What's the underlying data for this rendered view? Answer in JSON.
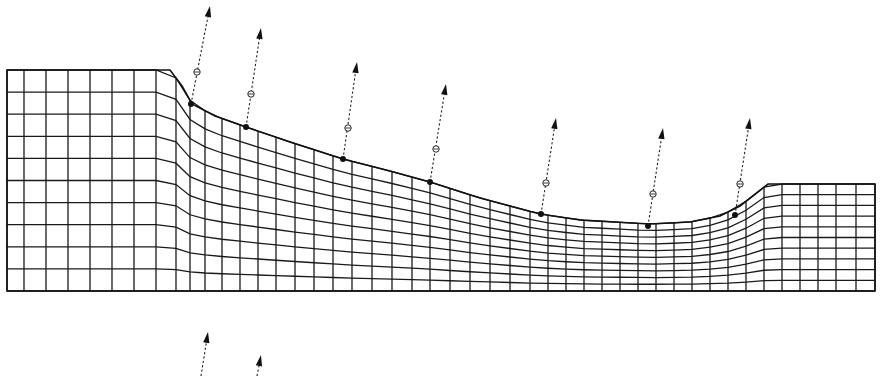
{
  "figure": {
    "width": 881,
    "height": 376,
    "colors": {
      "line": "#1a1a1a",
      "background": "#ffffff"
    }
  },
  "mesh": {
    "left_x": 7,
    "right_x": 875,
    "bottom_y": 291,
    "rows": 10,
    "surface_profile": [
      [
        7,
        70
      ],
      [
        170,
        70
      ],
      [
        182,
        86
      ],
      [
        192,
        104
      ],
      [
        215,
        116
      ],
      [
        246,
        127
      ],
      [
        290,
        142
      ],
      [
        343,
        159
      ],
      [
        390,
        171
      ],
      [
        430,
        182
      ],
      [
        480,
        198
      ],
      [
        540,
        214
      ],
      [
        580,
        220
      ],
      [
        615,
        222
      ],
      [
        650,
        224
      ],
      [
        690,
        222
      ],
      [
        720,
        216
      ],
      [
        740,
        206
      ],
      [
        768,
        184
      ],
      [
        875,
        184
      ]
    ],
    "columns_x": [
      7,
      24,
      46,
      68,
      90,
      112,
      134,
      156,
      176,
      190,
      205,
      222,
      240,
      258,
      276,
      295,
      314,
      333,
      352,
      372,
      392,
      412,
      430,
      450,
      470,
      490,
      510,
      530,
      548,
      566,
      584,
      602,
      620,
      638,
      656,
      674,
      692,
      710,
      728,
      746,
      764,
      782,
      800,
      818,
      836,
      856,
      875
    ]
  },
  "normal_vectors": [
    {
      "node": [
        191,
        104
      ],
      "mid": [
        197,
        72
      ],
      "tip": [
        210,
        6
      ]
    },
    {
      "node": [
        246,
        127
      ],
      "mid": [
        251,
        94
      ],
      "tip": [
        261,
        28
      ]
    },
    {
      "node": [
        343,
        159
      ],
      "mid": [
        348,
        128
      ],
      "tip": [
        357,
        62
      ]
    },
    {
      "node": [
        430,
        182
      ],
      "mid": [
        436,
        149
      ],
      "tip": [
        446,
        84
      ]
    },
    {
      "node": [
        541,
        214
      ],
      "mid": [
        546,
        183
      ],
      "tip": [
        556,
        118
      ]
    },
    {
      "node": [
        648,
        226
      ],
      "mid": [
        653,
        194
      ],
      "tip": [
        663,
        128
      ]
    },
    {
      "node": [
        735,
        215
      ],
      "mid": [
        740,
        184
      ],
      "tip": [
        750,
        118
      ]
    }
  ],
  "partial_vectors": [
    {
      "start": [
        201,
        376
      ],
      "tip": [
        208,
        332
      ]
    },
    {
      "start": [
        257,
        376
      ],
      "tip": [
        261,
        355
      ]
    }
  ]
}
